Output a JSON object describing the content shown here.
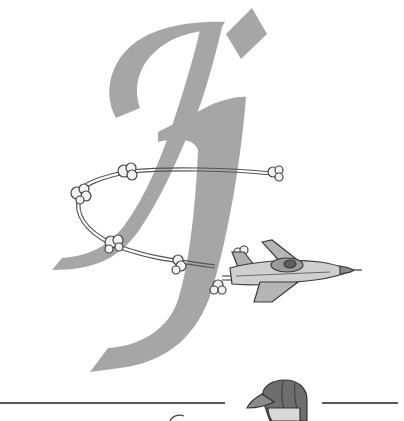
{
  "illustration": {
    "letterform": {
      "glyph": "Jj",
      "color": "#a6a6a6"
    },
    "plane": {
      "body_color": "#c9c9c9",
      "outline_color": "#3a3a3a",
      "trail_color": "#555555"
    },
    "divider": {
      "color": "#5a5a5a"
    },
    "figure": {
      "cap_color": "#6e6e6e"
    },
    "background": "#ffffff"
  }
}
